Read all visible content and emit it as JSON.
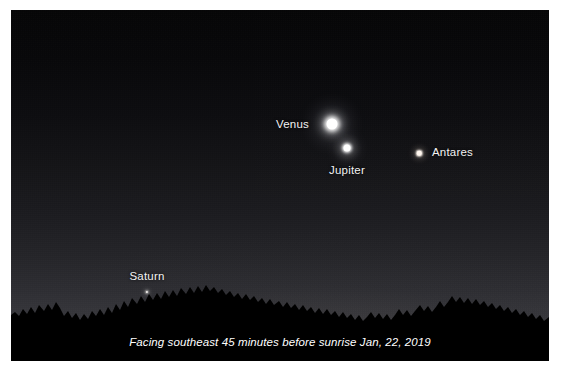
{
  "image": {
    "title": "Predawn sky view",
    "caption": "Facing southeast 45 minutes before sunrise Jan, 22, 2019",
    "direction": "southeast",
    "time_note": "45 minutes before sunrise",
    "date": "Jan, 22, 2019"
  },
  "colors": {
    "sky_top": "#060607",
    "sky_horizon": "#444449",
    "silhouette": "#000000",
    "label_text": "#f2f2f2",
    "caption_text": "#ffffff",
    "frame": "#ffffff",
    "venus": "#ffffff",
    "jupiter": "#ffffff",
    "antares": "#fff6ee",
    "saturn": "#f4f2ee"
  },
  "objects": [
    {
      "id": "venus",
      "name": "Venus",
      "type": "planet",
      "x": 321,
      "y": 114,
      "size": 11,
      "brightness": "brightest",
      "label_x": 298,
      "label_y": 115,
      "label_anchor": "right"
    },
    {
      "id": "jupiter",
      "name": "Jupiter",
      "type": "planet",
      "x": 336,
      "y": 138,
      "size": 7,
      "brightness": "bright",
      "label_x": 336,
      "label_y": 155,
      "label_anchor": "below"
    },
    {
      "id": "antares",
      "name": "Antares",
      "type": "star",
      "x": 408,
      "y": 143,
      "size": 4.5,
      "brightness": "moderate",
      "label_x": 421,
      "label_y": 143,
      "label_anchor": "left"
    },
    {
      "id": "saturn",
      "name": "Saturn",
      "type": "planet",
      "x": 136,
      "y": 282,
      "size": 2.2,
      "brightness": "faint",
      "label_x": 136,
      "label_y": 272,
      "label_anchor": "above"
    }
  ]
}
